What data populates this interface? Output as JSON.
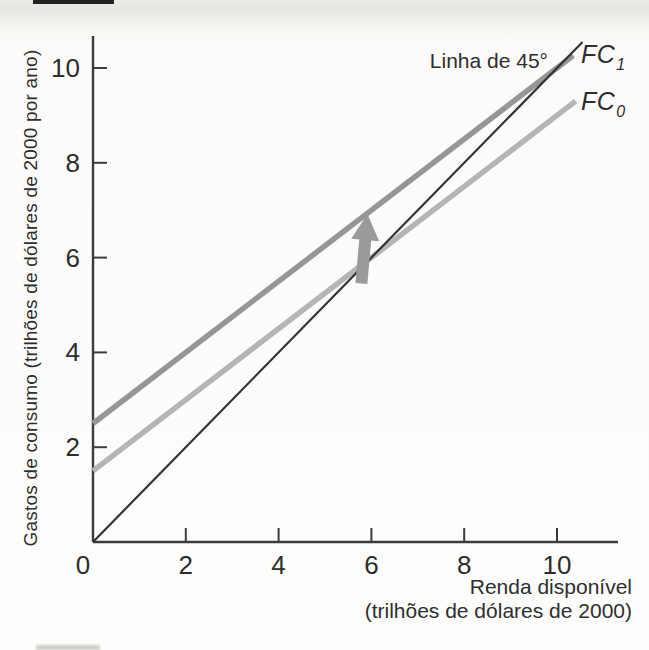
{
  "figure": {
    "background": "#fdfdfb",
    "text_color": "#2d2d2d"
  },
  "chart_data": {
    "type": "line",
    "title": "",
    "xlabel": "Renda disponível",
    "xlabel_line2": "(trilhões de dólares de 2000)",
    "ylabel": "Gastos de consumo (trilhões de dólares de 2000 por ano)",
    "xlim": [
      0,
      11.3
    ],
    "ylim": [
      0,
      10.7
    ],
    "xticks": [
      2,
      4,
      6,
      8,
      10
    ],
    "yticks": [
      2,
      4,
      6,
      8,
      10
    ],
    "origin_tick_label": "0",
    "grid": false,
    "legend_position": "labels-at-line-ends",
    "axis_color": "#3c3c3c",
    "series": [
      {
        "name": "FC0",
        "label_base": "FC",
        "label_sub": "0",
        "kind": "linear",
        "intercept": 1.5,
        "slope": 0.75,
        "x_start": 0,
        "x_end": 10.4,
        "points": [
          [
            0,
            1.5
          ],
          [
            10.4,
            9.3
          ]
        ],
        "color": "#b5b5b5",
        "stroke_width": 5.5
      },
      {
        "name": "FC1",
        "label_base": "FC",
        "label_sub": "1",
        "kind": "linear",
        "intercept": 2.5,
        "slope": 0.75,
        "x_start": 0,
        "x_end": 10.35,
        "points": [
          [
            0,
            2.5
          ],
          [
            10.35,
            10.26
          ]
        ],
        "color": "#969696",
        "stroke_width": 5.5
      },
      {
        "name": "linha-45-graus",
        "label": "Linha de 45°",
        "kind": "linear",
        "intercept": 0,
        "slope": 1,
        "x_start": 0,
        "x_end": 10.55,
        "points": [
          [
            0,
            0
          ],
          [
            10.55,
            10.55
          ]
        ],
        "color": "#333333",
        "stroke_width": 2.2
      }
    ],
    "annotations": {
      "shift_arrow": {
        "x": 5.85,
        "y_from": 5.45,
        "y_to": 6.92,
        "direction": "up",
        "color": "#9a9a9a",
        "meaning": "upward shift of consumption function from FC0 to FC1"
      },
      "intersections_with_45_line": [
        {
          "series": "FC0",
          "x": 6,
          "y": 6
        },
        {
          "series": "FC1",
          "x": 10,
          "y": 10
        }
      ]
    }
  }
}
